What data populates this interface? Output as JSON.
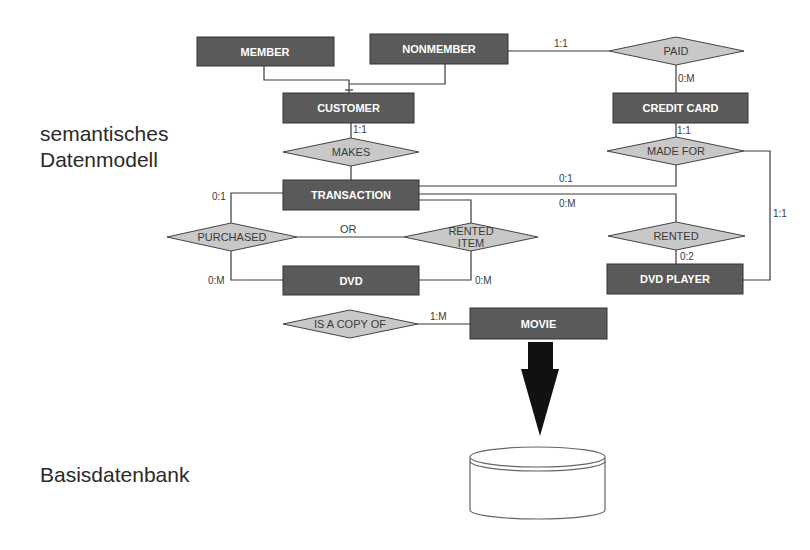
{
  "labels": {
    "semantic_line1": "semantisches",
    "semantic_line2": "Datenmodell",
    "base": "Basisdatenbank"
  },
  "entities": {
    "member": "MEMBER",
    "nonmember": "NONMEMBER",
    "customer": "CUSTOMER",
    "credit_card": "CREDIT CARD",
    "transaction": "TRANSACTION",
    "dvd": "DVD",
    "dvd_player": "DVD PLAYER",
    "movie": "MOVIE"
  },
  "relationships": {
    "paid": "PAID",
    "makes": "MAKES",
    "made_for": "MADE FOR",
    "purchased": "PURCHASED",
    "rented_item_line1": "RENTED",
    "rented_item_line2": "ITEM",
    "rented": "RENTED",
    "is_a_copy_of": "IS A COPY OF"
  },
  "annotations": {
    "or": "OR"
  },
  "cardinalities": {
    "nonmember_paid": "1:1",
    "paid_creditcard": "0:M",
    "customer_makes": "1:1",
    "creditcard_madefor": "1:1",
    "transaction_madefor": "0:1",
    "transaction_rented": "0:M",
    "transaction_purchased": "0:1",
    "purchased_dvd": "0:M",
    "renteditem_dvd": "0:M",
    "rented_dvdplayer": "0:2",
    "madefor_dvdplayer": "1:1",
    "copy_movie": "1:M"
  },
  "colors": {
    "entity_fill": "#5a5a5a",
    "relationship_fill": "#c8c8c8",
    "arrow": "#111111"
  }
}
